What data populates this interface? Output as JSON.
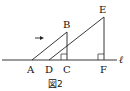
{
  "figure": {
    "caption": "図2",
    "line_label": "ℓ",
    "points": {
      "A": "A",
      "B": "B",
      "C": "C",
      "D": "D",
      "E": "E",
      "F": "F"
    },
    "arrow": "right-arrow",
    "stroke_color": "#222222"
  }
}
